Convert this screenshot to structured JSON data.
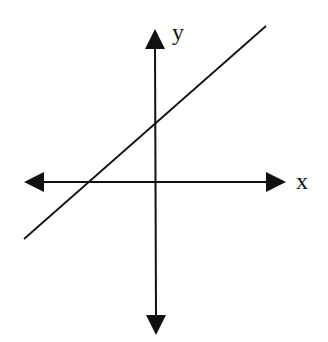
{
  "diagram": {
    "type": "coordinate-plane-with-line",
    "axes": {
      "x_label": "x",
      "y_label": "y"
    },
    "line": {
      "description": "straight line with positive slope, positive y-intercept, negative x-intercept"
    },
    "colors": {
      "stroke": "#111111",
      "background": "#ffffff"
    }
  }
}
